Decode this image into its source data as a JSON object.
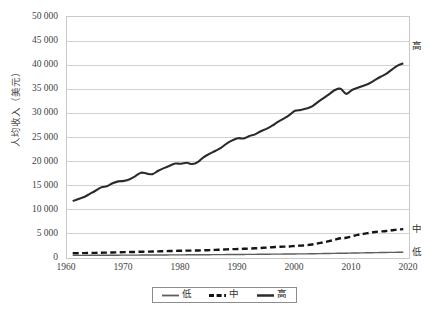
{
  "chart_data": {
    "type": "line",
    "title": "",
    "xlabel": "",
    "ylabel": "人均收入（美元）",
    "xlim": [
      1960,
      2020
    ],
    "ylim": [
      0,
      50000
    ],
    "grid": true,
    "legend_position": "bottom",
    "x_ticks": [
      1960,
      1970,
      1980,
      1990,
      2000,
      2010,
      2020
    ],
    "y_ticks": [
      0,
      5000,
      10000,
      15000,
      20000,
      25000,
      30000,
      35000,
      40000,
      45000,
      50000
    ],
    "y_tick_labels": [
      "0",
      "5 000",
      "10 000",
      "15 000",
      "20 000",
      "25 000",
      "30 000",
      "35 000",
      "40 000",
      "45 000",
      "50 000"
    ],
    "x": [
      1961,
      1962,
      1963,
      1964,
      1965,
      1966,
      1967,
      1968,
      1969,
      1970,
      1971,
      1972,
      1973,
      1974,
      1975,
      1976,
      1977,
      1978,
      1979,
      1980,
      1981,
      1982,
      1983,
      1984,
      1985,
      1986,
      1987,
      1988,
      1989,
      1990,
      1991,
      1992,
      1993,
      1994,
      1995,
      1996,
      1997,
      1998,
      1999,
      2000,
      2001,
      2002,
      2003,
      2004,
      2005,
      2006,
      2007,
      2008,
      2009,
      2010,
      2011,
      2012,
      2013,
      2014,
      2015,
      2016,
      2017,
      2018,
      2019
    ],
    "series": [
      {
        "name": "高",
        "label": "高",
        "style": "solid-thick",
        "color": "#2b2b2b",
        "end_label_value": 44000,
        "values": [
          11800,
          12250,
          12650,
          13300,
          13950,
          14650,
          14900,
          15500,
          15900,
          16000,
          16350,
          17000,
          17700,
          17500,
          17400,
          18100,
          18650,
          19150,
          19600,
          19550,
          19750,
          19500,
          19950,
          20950,
          21600,
          22200,
          22850,
          23750,
          24400,
          24850,
          24800,
          25300,
          25650,
          26300,
          26800,
          27450,
          28250,
          28900,
          29650,
          30550,
          30700,
          31000,
          31450,
          32350,
          33150,
          34000,
          34850,
          35100,
          34050,
          34850,
          35300,
          35750,
          36200,
          36900,
          37600,
          38200,
          39100,
          39900,
          40400
        ]
      },
      {
        "name": "中",
        "label": "中",
        "style": "dashed",
        "color": "#151515",
        "end_label_value": 6000,
        "values": [
          980,
          990,
          1010,
          1040,
          1070,
          1100,
          1120,
          1150,
          1190,
          1210,
          1230,
          1260,
          1300,
          1320,
          1340,
          1380,
          1410,
          1440,
          1480,
          1500,
          1530,
          1540,
          1560,
          1600,
          1640,
          1680,
          1720,
          1780,
          1830,
          1870,
          1910,
          1960,
          2010,
          2080,
          2150,
          2230,
          2310,
          2350,
          2400,
          2500,
          2570,
          2650,
          2800,
          3020,
          3250,
          3500,
          3800,
          4100,
          4200,
          4500,
          4800,
          5000,
          5200,
          5400,
          5500,
          5600,
          5750,
          5900,
          6000
        ]
      },
      {
        "name": "低",
        "label": "低",
        "style": "solid-thin",
        "color": "#5d5d5d",
        "end_label_value": 1200,
        "values": [
          540,
          545,
          550,
          556,
          562,
          568,
          572,
          578,
          585,
          590,
          596,
          602,
          610,
          616,
          620,
          628,
          634,
          640,
          648,
          654,
          660,
          664,
          670,
          678,
          686,
          694,
          702,
          712,
          722,
          730,
          738,
          748,
          758,
          770,
          782,
          794,
          806,
          816,
          826,
          840,
          852,
          866,
          882,
          900,
          920,
          940,
          962,
          984,
          1000,
          1022,
          1046,
          1068,
          1090,
          1110,
          1130,
          1148,
          1166,
          1184,
          1200
        ]
      }
    ]
  },
  "axis": {
    "y_title": "人均收入（美元）"
  },
  "legend": {
    "items": [
      {
        "label": "低",
        "style": "solid-thin",
        "color": "#5d5d5d"
      },
      {
        "label": "中",
        "style": "dashed",
        "color": "#151515"
      },
      {
        "label": "高",
        "style": "solid-thick",
        "color": "#2b2b2b"
      }
    ]
  }
}
